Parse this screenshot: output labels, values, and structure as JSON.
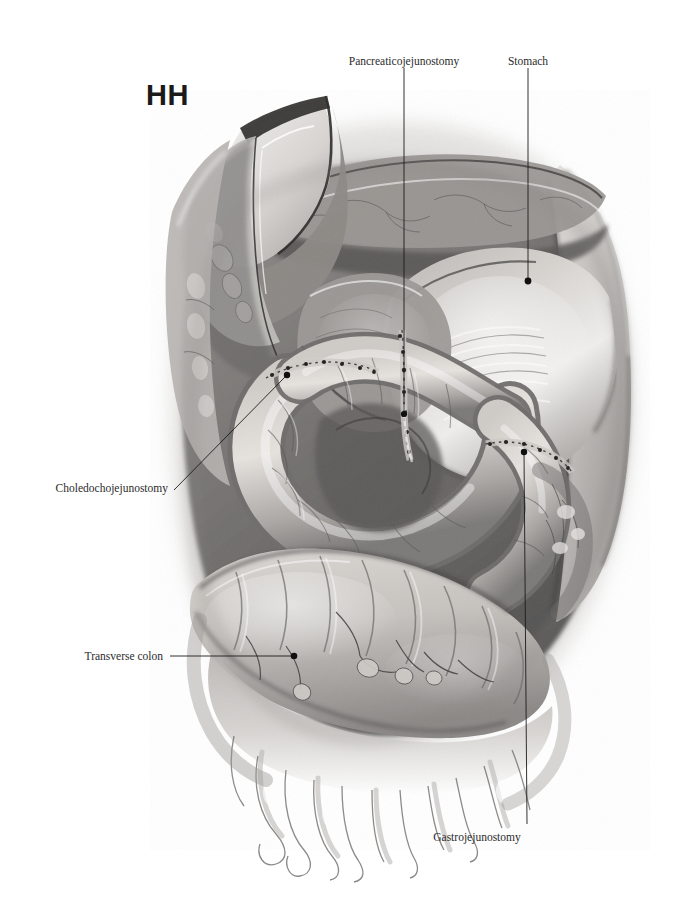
{
  "figure": {
    "id_label": "HH",
    "type": "surgical anatomical illustration",
    "style": "grayscale watercolor / gouache medical illustration",
    "background_color": "#ffffff",
    "ink_color": "#1c1c1c"
  },
  "callouts": [
    {
      "key": "pancreaticojejunostomy",
      "label": "Pancreaticojejunostomy",
      "anchor": "center",
      "text_x": 404,
      "text_y": 55,
      "leader": {
        "x1": 404,
        "y1": 68,
        "x2": 404,
        "y2": 414
      },
      "dot": {
        "x": 404,
        "y": 414,
        "r": 3.1
      }
    },
    {
      "key": "stomach",
      "label": "Stomach",
      "anchor": "center",
      "text_x": 528,
      "text_y": 55,
      "leader": {
        "x1": 528,
        "y1": 68,
        "x2": 528,
        "y2": 281
      },
      "dot": {
        "x": 528,
        "y": 281,
        "r": 3.4
      }
    },
    {
      "key": "choledochojejunostomy",
      "label": "Choledochojejunostomy",
      "anchor": "right",
      "text_x": 168,
      "text_y": 482,
      "leader": {
        "x1": 174,
        "y1": 490,
        "x2": 286,
        "y2": 376
      },
      "dot": {
        "x": 287,
        "y": 375,
        "r": 3.2
      }
    },
    {
      "key": "transverse-colon",
      "label": "Transverse colon",
      "anchor": "right",
      "text_x": 163,
      "text_y": 650,
      "leader": {
        "x1": 170,
        "y1": 656,
        "x2": 293,
        "y2": 656
      },
      "dot": {
        "x": 294,
        "y": 656,
        "r": 3.3
      }
    },
    {
      "key": "gastrojejunostomy",
      "label": "Gastrojejunostomy",
      "anchor": "center",
      "text_x": 477,
      "text_y": 831,
      "leader": {
        "x1": 524,
        "y1": 452,
        "x2": 527,
        "y2": 824
      },
      "dot": {
        "x": 524,
        "y": 452,
        "r": 3.2
      }
    }
  ],
  "structures": [
    {
      "name": "abdominal wall flap",
      "note": "retracted upper-left, pale cut edge with skin and fascia layers"
    },
    {
      "name": "stomach",
      "note": "large pale organ, upper right quadrant"
    },
    {
      "name": "jejunal limb",
      "note": "central coiled small bowel loop carrying the anastomoses"
    },
    {
      "name": "pancreatic remnant",
      "note": "upper mid, joined to jejunum"
    },
    {
      "name": "transverse colon",
      "note": "broad haustrated bowel across lower third"
    },
    {
      "name": "greater omentum",
      "note": "fringed apron hanging below the transverse colon"
    },
    {
      "name": "suture lines",
      "note": "fine dark stitch marks along each anastomosis"
    }
  ],
  "palette": {
    "paper": "#ffffff",
    "tissue_light": "#d9d6d2",
    "tissue_mid": "#a8a5a2",
    "tissue_dark": "#6e6c6b",
    "shadow": "#474646",
    "line": "#1c1c1c",
    "highlight": "#f2f1ef"
  }
}
